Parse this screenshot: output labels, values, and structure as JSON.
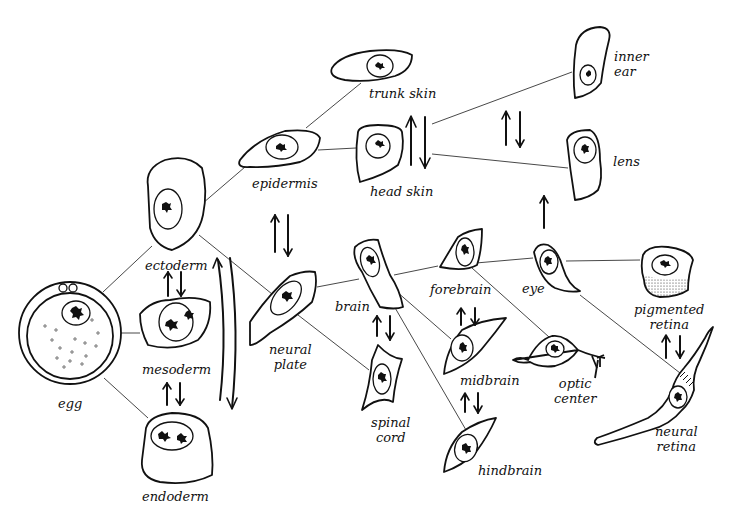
{
  "diagram": {
    "type": "cell differentiation lineage",
    "background": "#ffffff",
    "ink_color": "#111111",
    "nodes": [
      {
        "id": "egg",
        "label": "egg"
      },
      {
        "id": "ectoderm",
        "label": "ectoderm"
      },
      {
        "id": "mesoderm",
        "label": "mesoderm"
      },
      {
        "id": "endoderm",
        "label": "endoderm"
      },
      {
        "id": "epidermis",
        "label": "epidermis"
      },
      {
        "id": "trunk_skin",
        "label": "trunk skin"
      },
      {
        "id": "head_skin",
        "label": "head skin"
      },
      {
        "id": "inner_ear",
        "label_line1": "inner",
        "label_line2": "ear"
      },
      {
        "id": "lens",
        "label": "lens"
      },
      {
        "id": "neural_plate",
        "label_line1": "neural",
        "label_line2": "plate"
      },
      {
        "id": "brain",
        "label": "brain"
      },
      {
        "id": "spinal_cord",
        "label_line1": "spinal",
        "label_line2": "cord"
      },
      {
        "id": "forebrain",
        "label": "forebrain"
      },
      {
        "id": "midbrain",
        "label": "midbrain"
      },
      {
        "id": "hindbrain",
        "label": "hindbrain"
      },
      {
        "id": "eye",
        "label": "eye"
      },
      {
        "id": "optic_center",
        "label_line1": "optic",
        "label_line2": "center"
      },
      {
        "id": "pigmented_retina",
        "label_line1": "pigmented",
        "label_line2": "retina"
      },
      {
        "id": "neural_retina",
        "label_line1": "neural",
        "label_line2": "retina"
      }
    ],
    "edges": [
      [
        "egg",
        "ectoderm"
      ],
      [
        "egg",
        "mesoderm"
      ],
      [
        "egg",
        "endoderm"
      ],
      [
        "ectoderm",
        "epidermis"
      ],
      [
        "ectoderm",
        "neural_plate"
      ],
      [
        "epidermis",
        "trunk_skin"
      ],
      [
        "epidermis",
        "head_skin"
      ],
      [
        "head_skin",
        "inner_ear"
      ],
      [
        "head_skin",
        "lens"
      ],
      [
        "neural_plate",
        "brain"
      ],
      [
        "neural_plate",
        "spinal_cord"
      ],
      [
        "brain",
        "forebrain"
      ],
      [
        "brain",
        "midbrain"
      ],
      [
        "brain",
        "hindbrain"
      ],
      [
        "forebrain",
        "eye"
      ],
      [
        "forebrain",
        "optic_center"
      ],
      [
        "eye",
        "pigmented_retina"
      ],
      [
        "eye",
        "neural_retina"
      ]
    ],
    "interactions": [
      {
        "between": [
          "ectoderm",
          "mesoderm"
        ],
        "type": "bidirectional"
      },
      {
        "between": [
          "mesoderm",
          "endoderm"
        ],
        "type": "bidirectional"
      },
      {
        "between": [
          "ectoderm",
          "endoderm"
        ],
        "type": "bidirectional-long"
      },
      {
        "between": [
          "epidermis",
          "neural_plate"
        ],
        "type": "bidirectional"
      },
      {
        "between": [
          "brain",
          "spinal_cord"
        ],
        "type": "bidirectional"
      },
      {
        "between": [
          "forebrain",
          "midbrain"
        ],
        "type": "bidirectional"
      },
      {
        "between": [
          "midbrain",
          "hindbrain"
        ],
        "type": "bidirectional"
      },
      {
        "between": [
          "inner_ear",
          "lens"
        ],
        "type": "bidirectional"
      },
      {
        "between": [
          "head_skin",
          "head_skin_branches"
        ],
        "type": "bidirectional"
      },
      {
        "between": [
          "eye",
          "lens"
        ],
        "type": "unidirectional-up"
      },
      {
        "between": [
          "pigmented_retina",
          "neural_retina"
        ],
        "type": "bidirectional"
      }
    ]
  }
}
